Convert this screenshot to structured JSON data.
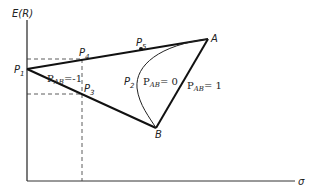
{
  "diagram": {
    "y_axis_label": "E(R)",
    "x_axis_label": "σ",
    "points": {
      "P1": "P",
      "P1_sub": "1",
      "P2": "P",
      "P2_sub": "2",
      "P3": "P",
      "P3_sub": "3",
      "P4": "P",
      "P4_sub": "4",
      "P5": "P",
      "P5_sub": "5",
      "A": "A",
      "B": "B"
    },
    "correlation_labels": {
      "neg_one": {
        "rho": "P",
        "sub": "AB",
        "value": "=-1"
      },
      "zero": {
        "rho": "P",
        "sub": "AB",
        "value": "= 0"
      },
      "one": {
        "rho": "P",
        "sub": "AB",
        "value": "= 1"
      }
    },
    "colors": {
      "line": "#1a1a1a",
      "dashed": "#333333"
    }
  }
}
